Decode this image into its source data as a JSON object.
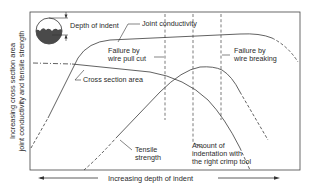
{
  "diagram": {
    "title": "",
    "y_axis_label_line1": "Increasing cross section area",
    "y_axis_label_line2": "joint conductivity and tensile strength",
    "x_axis_label": "Increasing depth of indent",
    "inset_label": "Depth of indent",
    "curves": {
      "joint_conductivity": "Joint conductivity",
      "cross_section_area": "Cross section area",
      "tensile_strength_line1": "Tensile",
      "tensile_strength_line2": "strength"
    },
    "annotations": {
      "pull_cut_line1": "Failure by",
      "pull_cut_line2": "wire pull cut",
      "breaking_line1": "Failure by",
      "breaking_line2": "wire breaking",
      "right_tool_line1": "Amount of",
      "right_tool_line2": "indentation with",
      "right_tool_line3": "the right crimp tool"
    },
    "colors": {
      "line": "#3a3a3a",
      "background": "#ffffff"
    }
  }
}
